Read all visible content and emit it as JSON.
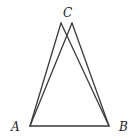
{
  "diagram": {
    "labels": {
      "A": "A",
      "B": "B",
      "C": "C"
    },
    "points": {
      "A": [
        30,
        126
      ],
      "B": [
        109,
        126
      ],
      "C_left": [
        61,
        23
      ],
      "C_right": [
        72,
        23
      ]
    },
    "segments": [
      [
        "A",
        "B"
      ],
      [
        "A",
        "C_left"
      ],
      [
        "A",
        "C_right"
      ],
      [
        "C_left",
        "B"
      ],
      [
        "C_right",
        "B"
      ]
    ],
    "colors": {
      "stroke": "#3a3a3a",
      "label": "#222222",
      "background": "#ffffff"
    }
  }
}
